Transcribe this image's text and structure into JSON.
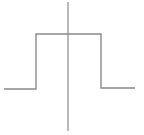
{
  "diagram": {
    "type": "rectangular-pulse-function",
    "colors": {
      "line": "#8a8a8a",
      "axis": "#8a8a8a",
      "background": "#ffffff"
    },
    "axis": {
      "x": 68,
      "y1": 2,
      "y2": 131
    },
    "pulse": {
      "low_left": {
        "x1": 4,
        "x2": 36,
        "y": 89
      },
      "rise": {
        "x": 36,
        "y1": 89,
        "y2": 34
      },
      "high": {
        "x1": 36,
        "x2": 101,
        "y": 34
      },
      "fall": {
        "x": 101,
        "y1": 34,
        "y2": 88
      },
      "low_right": {
        "x1": 101,
        "x2": 135,
        "y": 88
      }
    }
  }
}
